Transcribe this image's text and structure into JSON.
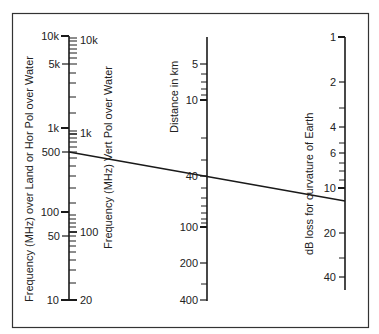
{
  "diagram": {
    "type": "nomogram",
    "colors": {
      "line": "#1a1a1a",
      "text": "#222222",
      "frame": "#333333",
      "background": "#ffffff"
    },
    "scales": {
      "freq_land": {
        "title": "Frequency (MHz) over Land or Hor Pol over Water",
        "labels": [
          {
            "text": "10k",
            "y": 36
          },
          {
            "text": "5k",
            "y": 64
          },
          {
            "text": "1k",
            "y": 128
          },
          {
            "text": "500",
            "y": 152
          },
          {
            "text": "100",
            "y": 212
          },
          {
            "text": "50",
            "y": 236
          },
          {
            "text": "10",
            "y": 300
          }
        ]
      },
      "freq_vert": {
        "title": "Frequency (MHz) Vert Pol over Water",
        "labels": [
          {
            "text": "10k",
            "y": 40
          },
          {
            "text": "1k",
            "y": 133
          },
          {
            "text": "100",
            "y": 232
          },
          {
            "text": "20",
            "y": 300
          }
        ]
      },
      "distance": {
        "title": "Distance in km",
        "labels": [
          {
            "text": "5",
            "y": 64
          },
          {
            "text": "10",
            "y": 100
          },
          {
            "text": "40",
            "y": 176
          },
          {
            "text": "100",
            "y": 227
          },
          {
            "text": "200",
            "y": 263
          },
          {
            "text": "400",
            "y": 300
          }
        ]
      },
      "db_loss": {
        "title": "dB loss for curvature of Earth",
        "labels": [
          {
            "text": "1",
            "y": 37
          },
          {
            "text": "2",
            "y": 82
          },
          {
            "text": "4",
            "y": 127
          },
          {
            "text": "6",
            "y": 153
          },
          {
            "text": "10",
            "y": 188
          },
          {
            "text": "20",
            "y": 233
          },
          {
            "text": "40",
            "y": 277
          }
        ]
      }
    },
    "example_line": {
      "frequency_mhz": "500",
      "distance_km": "40",
      "db_loss": "~12"
    }
  }
}
